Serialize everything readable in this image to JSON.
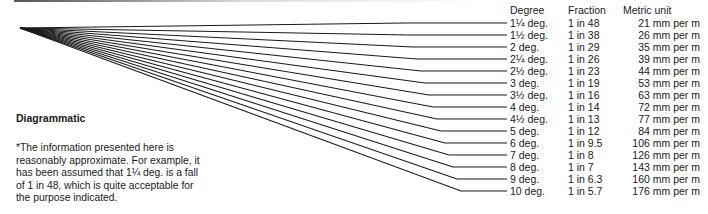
{
  "diagram": {
    "title": "Diagrammatic",
    "note": "*The information presented here is reasonably approximate. For example, it has been assumed that 1¼ deg. is a fall of 1 in 48, which is quite acceptable for the purpose indicated.",
    "line_color": "#1a1a1a",
    "origin": [
      20,
      28
    ]
  },
  "table": {
    "headers": {
      "degree": "Degree",
      "fraction": "Fraction",
      "metric": "Metric unit"
    },
    "rows": [
      {
        "degree": "1¼ deg.",
        "fraction": "1 in 48",
        "metric": "21 mm per m"
      },
      {
        "degree": "1½ deg.",
        "fraction": "1 in 38",
        "metric": "26 mm per m"
      },
      {
        "degree": "2 deg.",
        "fraction": "1 in 29",
        "metric": "35 mm per m"
      },
      {
        "degree": "2¼ deg.",
        "fraction": "1 in 26",
        "metric": "39 mm per m"
      },
      {
        "degree": "2½ deg.",
        "fraction": "1 in 23",
        "metric": "44 mm per m"
      },
      {
        "degree": "3 deg.",
        "fraction": "1 in 19",
        "metric": "53 mm per m"
      },
      {
        "degree": "3½ deg.",
        "fraction": "1 in 16",
        "metric": "63 mm per m"
      },
      {
        "degree": "4 deg.",
        "fraction": "1 in 14",
        "metric": "72 mm per m"
      },
      {
        "degree": "4½ deg.",
        "fraction": "1 in 13",
        "metric": "77 mm per m"
      },
      {
        "degree": "5 deg.",
        "fraction": "1 in 12",
        "metric": "84 mm per m"
      },
      {
        "degree": "6 deg.",
        "fraction": "1 in 9.5",
        "metric": "106 mm per m"
      },
      {
        "degree": "7 deg.",
        "fraction": "1 in 8",
        "metric": "126 mm per m"
      },
      {
        "degree": "8 deg.",
        "fraction": "1 in 7",
        "metric": "143 mm per m"
      },
      {
        "degree": "9 deg.",
        "fraction": "1 in 6.3",
        "metric": "160 mm per m"
      },
      {
        "degree": "10 deg.",
        "fraction": "1 in 5.7",
        "metric": "176 mm per m"
      }
    ]
  }
}
